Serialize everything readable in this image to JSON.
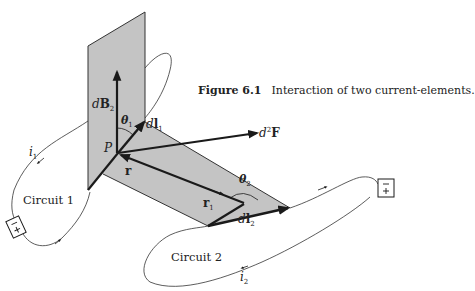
{
  "figure": {
    "number": "Figure 6.1",
    "caption": "Interaction of two current-elements."
  },
  "labels": {
    "dB2": {
      "prefix": "d",
      "main": "B",
      "sub": "2"
    },
    "theta1": {
      "main": "θ",
      "sub": "1"
    },
    "dl1": {
      "prefix": "d",
      "main": "l",
      "sub": "1"
    },
    "d2F": {
      "prefix": "d",
      "sup": "2",
      "main": "F"
    },
    "P": "P",
    "r": "r",
    "r1": {
      "main": "r",
      "sub": "1"
    },
    "theta2": {
      "main": "θ",
      "sub": "2"
    },
    "dl2": {
      "prefix": "d",
      "main": "l",
      "sub": "2"
    },
    "i1": {
      "main": "i",
      "sub": "1"
    },
    "i2": {
      "main": "i",
      "sub": "2"
    },
    "circuit1": "Circuit 1",
    "circuit2": "Circuit 2"
  },
  "batteries": [
    {
      "name": "battery-circuit-1",
      "top_sign": "−",
      "bottom_sign": "+"
    },
    {
      "name": "battery-circuit-2",
      "top_sign": "−",
      "bottom_sign": "+"
    }
  ],
  "colors": {
    "plane_fill": "#c4c4c4",
    "line": "#1a1a1a",
    "background": "#ffffff"
  }
}
